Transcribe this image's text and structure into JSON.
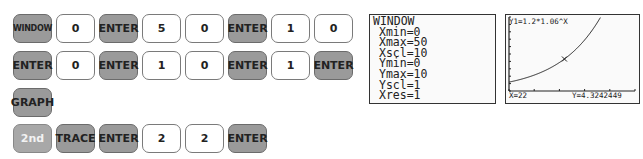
{
  "keystrokes": {
    "rows": [
      [
        {
          "label": "WINDOW",
          "style": "dark"
        },
        {
          "label": "0",
          "style": "light"
        },
        {
          "label": "ENTER",
          "style": "dark"
        },
        {
          "label": "5",
          "style": "light"
        },
        {
          "label": "0",
          "style": "light"
        },
        {
          "label": "ENTER",
          "style": "dark"
        },
        {
          "label": "1",
          "style": "light"
        },
        {
          "label": "0",
          "style": "light"
        }
      ],
      [
        {
          "label": "ENTER",
          "style": "dark"
        },
        {
          "label": "0",
          "style": "light"
        },
        {
          "label": "ENTER",
          "style": "dark"
        },
        {
          "label": "1",
          "style": "light"
        },
        {
          "label": "0",
          "style": "light"
        },
        {
          "label": "ENTER",
          "style": "dark"
        },
        {
          "label": "1",
          "style": "light"
        },
        {
          "label": "ENTER",
          "style": "dark"
        }
      ],
      [
        {
          "label": "GRAPH",
          "style": "dark"
        }
      ],
      [
        {
          "label": "2nd",
          "style": "second"
        },
        {
          "label": "TRACE",
          "style": "dark"
        },
        {
          "label": "ENTER",
          "style": "dark"
        },
        {
          "label": "2",
          "style": "light"
        },
        {
          "label": "2",
          "style": "light"
        },
        {
          "label": "ENTER",
          "style": "dark"
        }
      ]
    ]
  },
  "window_screen": {
    "title": "WINDOW",
    "lines": [
      "Xmin=0",
      "Xmax=50",
      "Xscl=10",
      "Ymin=0",
      "Ymax=10",
      "Yscl=1",
      "Xres=1"
    ]
  },
  "graph_screen": {
    "equation": "Y1=1.2*1.06^X",
    "x_readout": "X=22",
    "y_readout": "Y=4.3242449"
  },
  "chart_data": {
    "type": "line",
    "title": "Y1=1.2*1.06^X",
    "function": "1.2*1.06^x",
    "xlim": [
      0,
      50
    ],
    "ylim": [
      0,
      10
    ],
    "xscl": 10,
    "yscl": 1,
    "trace_point": {
      "x": 22,
      "y": 4.3242449
    }
  }
}
